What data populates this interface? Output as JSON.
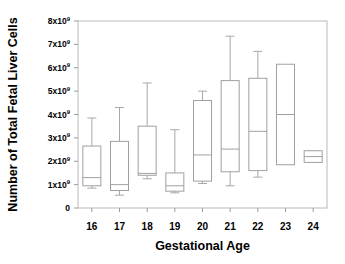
{
  "chart_data": {
    "type": "box",
    "title": "",
    "xlabel": "Gestational Age",
    "ylabel": "Number of Total Fetal Liver Cells",
    "categories": [
      "16",
      "17",
      "18",
      "19",
      "20",
      "21",
      "22",
      "23",
      "24"
    ],
    "ytick_labels": [
      "0",
      "1x10⁹",
      "2x10⁹",
      "3x10⁹",
      "4x10⁹",
      "5x10⁹",
      "6x10⁹",
      "7x10⁹",
      "8x10⁹"
    ],
    "ytick_mantissas": [
      "0",
      "1x10",
      "2x10",
      "3x10",
      "4x10",
      "5x10",
      "6x10",
      "7x10",
      "8x10"
    ],
    "ytick_exponents": [
      "",
      "9",
      "9",
      "9",
      "9",
      "9",
      "9",
      "9",
      "9"
    ],
    "ytick_values": [
      0,
      1000000000,
      2000000000,
      3000000000,
      4000000000,
      5000000000,
      6000000000,
      7000000000,
      8000000000
    ],
    "ylim": [
      0,
      8000000000
    ],
    "y_unit": 1000000000,
    "grid": false,
    "legend": false,
    "boxes": [
      {
        "category": "16",
        "whisker_low": 0.85,
        "q1": 0.95,
        "median": 1.3,
        "q3": 2.65,
        "whisker_high": 3.85,
        "has_low_cap": true,
        "has_high_cap": true
      },
      {
        "category": "17",
        "whisker_low": 0.55,
        "q1": 0.75,
        "median": 1.0,
        "q3": 2.85,
        "whisker_high": 4.3,
        "has_low_cap": true,
        "has_high_cap": true
      },
      {
        "category": "18",
        "whisker_low": 1.25,
        "q1": 1.4,
        "median": 1.48,
        "q3": 3.5,
        "whisker_high": 5.35,
        "has_low_cap": true,
        "has_high_cap": true
      },
      {
        "category": "19",
        "whisker_low": 0.65,
        "q1": 0.72,
        "median": 0.95,
        "q3": 1.5,
        "whisker_high": 3.35,
        "has_low_cap": true,
        "has_high_cap": true
      },
      {
        "category": "20",
        "whisker_low": 1.05,
        "q1": 1.15,
        "median": 2.27,
        "q3": 4.6,
        "whisker_high": 5.0,
        "has_low_cap": true,
        "has_high_cap": true
      },
      {
        "category": "21",
        "whisker_low": 0.95,
        "q1": 1.55,
        "median": 2.52,
        "q3": 5.45,
        "whisker_high": 7.35,
        "has_low_cap": true,
        "has_high_cap": true
      },
      {
        "category": "22",
        "whisker_low": 1.32,
        "q1": 1.6,
        "median": 3.28,
        "q3": 5.55,
        "whisker_high": 6.7,
        "has_low_cap": true,
        "has_high_cap": true
      },
      {
        "category": "23",
        "whisker_low": null,
        "q1": 1.85,
        "median": 4.0,
        "q3": 6.15,
        "whisker_high": null,
        "has_low_cap": false,
        "has_high_cap": false
      },
      {
        "category": "24",
        "whisker_low": null,
        "q1": 1.95,
        "median": 2.2,
        "q3": 2.45,
        "whisker_high": null,
        "has_low_cap": false,
        "has_high_cap": false
      }
    ]
  },
  "colors": {
    "background": "#ffffff",
    "frame": "#b9b9b9",
    "box_stroke": "#a0a0a0",
    "whisker": "#a8a8a8",
    "text": "#000000"
  }
}
